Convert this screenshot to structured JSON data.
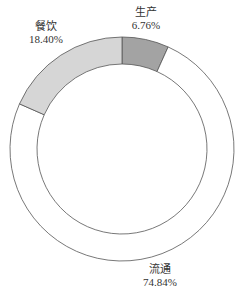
{
  "chart_data": {
    "type": "pie",
    "variant": "donut",
    "title": "",
    "start_angle": "12 o'clock",
    "direction": "clockwise",
    "slices": [
      {
        "label": "生产",
        "value": 6.76,
        "display": "6.76%",
        "color": "#a3a3a3"
      },
      {
        "label": "流通",
        "value": 74.84,
        "display": "74.84%",
        "color": "#ffffff"
      },
      {
        "label": "餐饮",
        "value": 18.4,
        "display": "18.40%",
        "color": "#d6d6d6"
      }
    ],
    "legend": "none",
    "stroke_color": "#555555"
  },
  "labels": {
    "production": {
      "name": "生产",
      "pct": "6.76%"
    },
    "circulation": {
      "name": "流通",
      "pct": "74.84%"
    },
    "catering": {
      "name": "餐饮",
      "pct": "18.40%"
    }
  }
}
